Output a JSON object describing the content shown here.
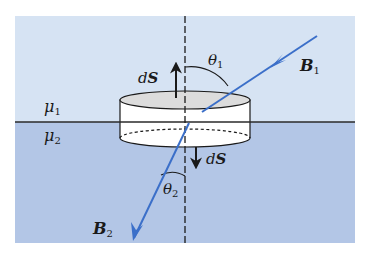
{
  "diagram": {
    "media": {
      "upper": {
        "label": "μ",
        "subscript": "1",
        "color": "#d6e3f3"
      },
      "lower": {
        "label": "μ",
        "subscript": "2",
        "color": "#b3c6e6"
      }
    },
    "vectors": {
      "b1": {
        "label": "B",
        "subscript": "1",
        "color": "#3b6fc9"
      },
      "b2": {
        "label": "B",
        "subscript": "2",
        "color": "#3b6fc9"
      },
      "ds_up": {
        "label": "dS"
      },
      "ds_down": {
        "label": "dS"
      }
    },
    "angles": {
      "theta1": {
        "label": "θ",
        "subscript": "1"
      },
      "theta2": {
        "label": "θ",
        "subscript": "2"
      }
    },
    "elements": {
      "pillbox": "cylindrical Gaussian pillbox straddling the interface",
      "normal_line": "dashed vertical normal to interface",
      "interface_line": "horizontal boundary line"
    }
  }
}
